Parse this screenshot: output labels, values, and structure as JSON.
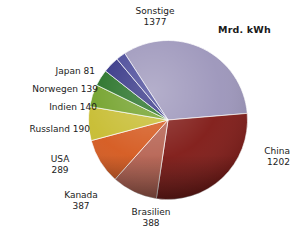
{
  "chart_data": {
    "type": "pie",
    "title": "",
    "unit_label": "Mrd. kWh",
    "total": 4193,
    "legend": "labels-outside",
    "grid": false,
    "categories": [
      "Sonstige",
      "China",
      "Brasilien",
      "Kanada",
      "USA",
      "Russland",
      "Indien",
      "Norwegen",
      "Japan"
    ],
    "values": [
      1377,
      1202,
      388,
      387,
      289,
      190,
      140,
      139,
      81
    ],
    "slices": [
      {
        "name": "Sonstige",
        "value": 1377,
        "color": "#9a93b9",
        "label_line1": "Sonstige",
        "label_line2": "1377",
        "label_align": "center"
      },
      {
        "name": "China",
        "value": 1202,
        "color": "#7d1511",
        "label_line1": "China",
        "label_line2": "1202",
        "label_align": "left"
      },
      {
        "name": "Brasilien",
        "value": 388,
        "color": "#b5604f",
        "label_line1": "Brasilien",
        "label_line2": "388",
        "label_align": "center"
      },
      {
        "name": "Kanada",
        "value": 387,
        "color": "#d4561a",
        "label_line1": "Kanada",
        "label_line2": "387",
        "label_align": "center"
      },
      {
        "name": "USA",
        "value": 289,
        "color": "#c6bb2c",
        "label_line1": "USA",
        "label_line2": "289",
        "label_align": "center"
      },
      {
        "name": "Russland",
        "value": 190,
        "color": "#6d9e22",
        "label_line1": "Russland 190",
        "label_line2": "",
        "label_align": "right"
      },
      {
        "name": "Indien",
        "value": 140,
        "color": "#1d6b1d",
        "label_line1": "Indien 140",
        "label_line2": "",
        "label_align": "right"
      },
      {
        "name": "Norwegen",
        "value": 139,
        "color": "#2b2b80",
        "label_line1": "Norwegen 139",
        "label_line2": "",
        "label_align": "right"
      },
      {
        "name": "Japan",
        "value": 81,
        "color": "#3f3f93",
        "label_line1": "Japan 81",
        "label_line2": "",
        "label_align": "right"
      }
    ]
  }
}
